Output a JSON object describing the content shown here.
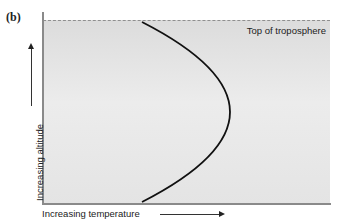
{
  "figure": {
    "panel_label": "(b)",
    "top_boundary_label": "Top of troposphere",
    "x_axis_label": "Increasing temperature",
    "y_axis_label": "Increasing altitude",
    "curve": {
      "description": "Temperature profile with altitude, bulging to higher temperature at mid-altitude",
      "points_px": [
        [
          142,
          22
        ],
        [
          231,
          112
        ],
        [
          142,
          202
        ]
      ]
    },
    "colors": {
      "plot_background": "#e4e4e4",
      "curve": "#111111",
      "axis": "#8a8a8a",
      "dashed_boundary": "#8f8f8f"
    }
  }
}
